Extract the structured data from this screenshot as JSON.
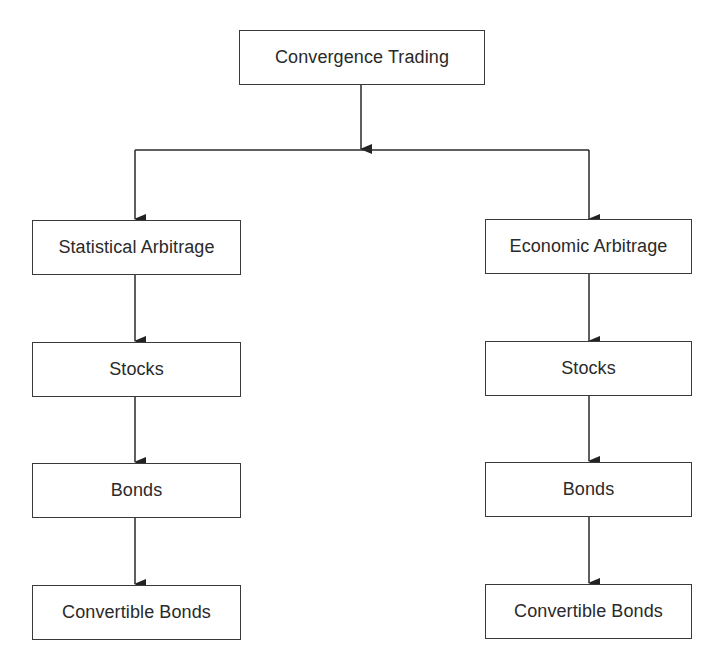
{
  "diagram": {
    "root": {
      "label": "Convergence Trading"
    },
    "branches": [
      {
        "label": "Statistical Arbitrage",
        "children": [
          "Stocks",
          "Bonds",
          "Convertible Bonds"
        ]
      },
      {
        "label": "Economic Arbitrage",
        "children": [
          "Stocks",
          "Bonds",
          "Convertible Bonds"
        ]
      }
    ],
    "colors": {
      "line": "#2a2a2a",
      "box_border": "#3a3a3a",
      "background": "#ffffff"
    }
  }
}
